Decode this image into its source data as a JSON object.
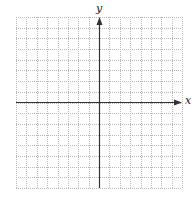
{
  "diagram": {
    "type": "coordinate-grid",
    "grid": {
      "columns": 16,
      "rows": 16,
      "left": 16,
      "top": 17,
      "right": 182,
      "bottom": 188,
      "line_color": "#b8b8b8",
      "line_style": "dotted"
    },
    "axes": {
      "x_label": "x",
      "y_label": "y",
      "origin_px": {
        "x": 99,
        "y": 102
      },
      "color": "#333333"
    }
  }
}
